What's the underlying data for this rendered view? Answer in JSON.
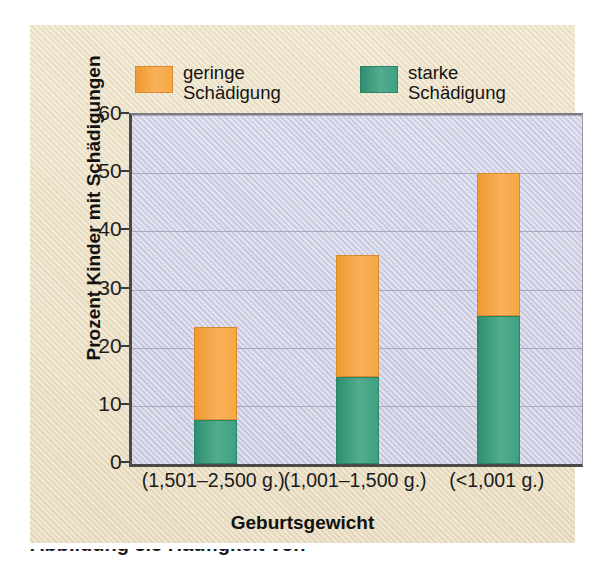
{
  "chart_data": {
    "type": "bar",
    "subtype": "stacked-bar",
    "title": "",
    "xlabel": "Geburtsgewicht",
    "ylabel": "Prozent Kinder mit Schädigungen",
    "categories": [
      "(1,501–2,500 g.)",
      "(1,001–1,500 g.)",
      "(<1,001 g.)"
    ],
    "series": [
      {
        "name": "starke Schädigung",
        "color": "#3ea183",
        "values": [
          7.5,
          15,
          25.5
        ]
      },
      {
        "name": "geringe Schädigung",
        "color": "#f6a845",
        "values": [
          16,
          21,
          24.5
        ]
      }
    ],
    "totals": [
      23.5,
      36,
      50
    ],
    "ylim": [
      0,
      60
    ],
    "yticks": [
      "0",
      "10",
      "20",
      "30",
      "40",
      "50",
      "60"
    ],
    "ytick_values": [
      0,
      10,
      20,
      30,
      40,
      50,
      60
    ],
    "grid": true,
    "grid_axis": "y",
    "legend_position": "top"
  },
  "legend": {
    "items": [
      {
        "swatch": "low-damage-swatch",
        "line1": "geringe",
        "line2": "Schädigung",
        "color": "#f6a845"
      },
      {
        "swatch": "high-damage-swatch",
        "line1": "starke",
        "line2": "Schädigung",
        "color": "#3ea183"
      }
    ]
  },
  "axes": {
    "y_title": "Prozent Kinder mit Schädigungen",
    "x_title": "Geburtsgewicht"
  },
  "caption": {
    "text": "Abbildung 3.5  Häufigkeit von"
  },
  "colors": {
    "page_background": "#ffffff",
    "panel_background": "#ece0c4",
    "plot_background": "#d3d4e6",
    "gridline": "#9fa0b8",
    "axis": "#4a4a4a",
    "low_damage": "#f6a845",
    "high_damage": "#3ea183"
  }
}
